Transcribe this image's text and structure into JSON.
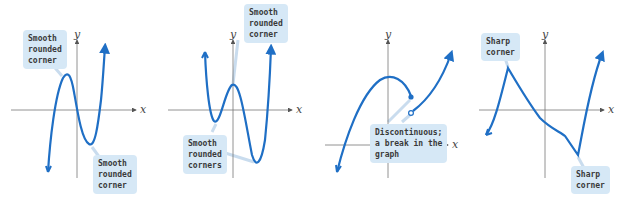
{
  "figure": {
    "colors": {
      "curve": "#1f6fc5",
      "axis": "#666666",
      "callout_bg": "#d6e8f6",
      "callout_text": "#3a3a3a",
      "leader": "#c9dcee"
    },
    "graphs": [
      {
        "id": "graph-1",
        "x_label": "x",
        "y_label": "y",
        "callouts": [
          "Smooth\nrounded\ncorner",
          "Smooth\nrounded\ncorner"
        ]
      },
      {
        "id": "graph-2",
        "x_label": "x",
        "y_label": "y",
        "callouts": [
          "Smooth\nrounded\ncorner",
          "Smooth\nrounded\ncorners"
        ]
      },
      {
        "id": "graph-3",
        "x_label": "x",
        "y_label": "y",
        "callouts": [
          "Discontinuous;\na break in the\ngraph"
        ]
      },
      {
        "id": "graph-4",
        "x_label": "x",
        "y_label": "y",
        "callouts": [
          "Sharp\ncorner",
          "Sharp\ncorner"
        ]
      }
    ]
  }
}
